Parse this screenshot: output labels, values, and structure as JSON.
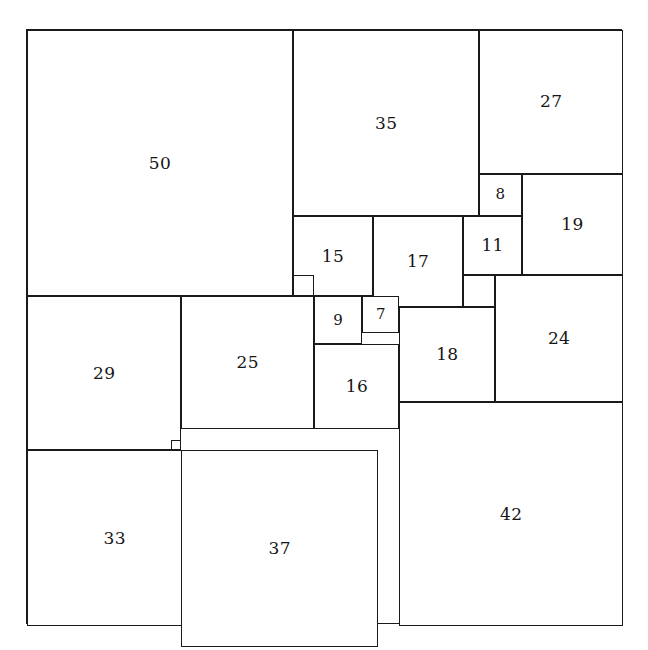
{
  "figure": {
    "outer_side": 112,
    "background_color": "#ffffff",
    "line_color": "#1a1a1a",
    "label_color": "#161616"
  },
  "chart_data": {
    "type": "diagram",
    "subtype": "squared-square-dissection",
    "outer_square_side": 112,
    "unit_scale_px": 5.3214,
    "origin_px": {
      "x": 26,
      "y": 29
    },
    "count": 21,
    "squares": [
      {
        "label": "50",
        "size": 50,
        "x": 0,
        "y": 0
      },
      {
        "label": "35",
        "size": 35,
        "x": 50,
        "y": 0
      },
      {
        "label": "27",
        "size": 27,
        "x": 85,
        "y": 0
      },
      {
        "label": "8",
        "size": 8,
        "x": 85,
        "y": 27
      },
      {
        "label": "19",
        "size": 19,
        "x": 93,
        "y": 27
      },
      {
        "label": "15",
        "size": 15,
        "x": 50,
        "y": 35
      },
      {
        "label": "17",
        "size": 17,
        "x": 65,
        "y": 35
      },
      {
        "label": "11",
        "size": 11,
        "x": 82,
        "y": 35
      },
      {
        "label": "6",
        "size": 6,
        "x": 82,
        "y": 46
      },
      {
        "label": "24",
        "size": 24,
        "x": 88,
        "y": 46
      },
      {
        "label": "29",
        "size": 29,
        "x": 0,
        "y": 50
      },
      {
        "label": "25",
        "size": 25,
        "x": 29,
        "y": 50
      },
      {
        "label": "9",
        "size": 9,
        "x": 54,
        "y": 50
      },
      {
        "label": "7",
        "size": 7,
        "x": 63,
        "y": 50
      },
      {
        "label": "18",
        "size": 18,
        "x": 70,
        "y": 52
      },
      {
        "label": "16",
        "size": 16,
        "x": 54,
        "y": 59
      },
      {
        "label": "42",
        "size": 42,
        "x": 70,
        "y": 70
      },
      {
        "label": "2",
        "size": 2,
        "x": 27,
        "y": 77
      },
      {
        "label": "33",
        "size": 33,
        "x": 0,
        "y": 79
      },
      {
        "label": "37",
        "size": 37,
        "x": 29,
        "y": 79
      },
      {
        "label": "4",
        "size": 4,
        "x": 50,
        "y": 46
      }
    ],
    "visible_labels": [
      "50",
      "35",
      "27",
      "8",
      "19",
      "15",
      "17",
      "11",
      "24",
      "29",
      "25",
      "9",
      "7",
      "18",
      "16",
      "42",
      "33",
      "37"
    ],
    "unlabeled_squares": [
      {
        "size": 6,
        "x": 82,
        "y": 46,
        "note": "small square between 11, 18 and 24 (no number drawn)"
      },
      {
        "size": 2,
        "x": 27,
        "y": 77,
        "note": "tiny square between 29, 25, 33 and 37 (no number drawn)"
      },
      {
        "size": 4,
        "x": 50,
        "y": 46,
        "note": "small square between 15, 25 and 9 (no number drawn)"
      }
    ]
  }
}
